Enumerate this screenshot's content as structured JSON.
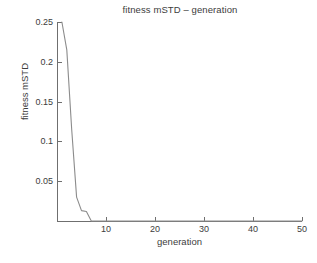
{
  "figure": {
    "background_color": "#ffffff",
    "axis_color": "#6f6f6f",
    "text_color": "#3c3c3c",
    "line_color": "#8c8c8c"
  },
  "chart_data": {
    "type": "line",
    "title": "fitness mSTD – generation",
    "xlabel": "generation",
    "ylabel": "fitness mSTD",
    "xlim": [
      0,
      50
    ],
    "ylim": [
      0,
      0.25
    ],
    "grid": false,
    "legend": null,
    "xticks": [
      10,
      20,
      30,
      40,
      50
    ],
    "xtick_labels": [
      "10",
      "20",
      "30",
      "40",
      "50"
    ],
    "yticks": [
      0.05,
      0.1,
      0.15,
      0.2,
      0.25
    ],
    "ytick_labels": [
      "0.05",
      "0.1",
      "0.15",
      "0.2",
      "0.25"
    ],
    "series": [
      {
        "name": "fitness mSTD",
        "color": "#8c8c8c",
        "x": [
          1,
          2,
          3,
          4,
          5,
          6,
          7,
          8,
          10,
          15,
          20,
          25,
          30,
          35,
          40,
          45,
          50
        ],
        "y": [
          0.25,
          0.215,
          0.115,
          0.03,
          0.013,
          0.012,
          0.0,
          0.0,
          0.0,
          0.0,
          0.0,
          0.0,
          0.0,
          0.0,
          0.0,
          0.0,
          0.0
        ]
      }
    ]
  },
  "caption": {
    "ghost_text": ""
  }
}
